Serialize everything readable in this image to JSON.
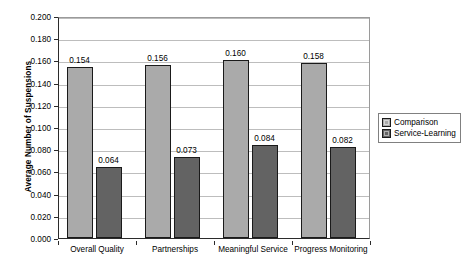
{
  "chart_data": {
    "type": "bar",
    "title": "",
    "xlabel": "",
    "ylabel": "Average Number of Suspensions",
    "ylim": [
      0,
      0.2
    ],
    "ytick_step": 0.02,
    "ytick_labels": [
      "0.000",
      "0.020",
      "0.040",
      "0.060",
      "0.080",
      "0.100",
      "0.120",
      "0.140",
      "0.160",
      "0.180",
      "0.200"
    ],
    "ytick_values": [
      0,
      0.02,
      0.04,
      0.06,
      0.08,
      0.1,
      0.12,
      0.14,
      0.16,
      0.18,
      0.2
    ],
    "grid": true,
    "legend_position": "right",
    "categories": [
      "Overall Quality",
      "Partnerships",
      "Meaningful Service",
      "Progress Monitoring"
    ],
    "series": [
      {
        "name": "Comparison",
        "color": "#aaaaaa",
        "values": [
          0.154,
          0.156,
          0.16,
          0.158
        ],
        "labels": [
          "0.154",
          "0.156",
          "0.160",
          "0.158"
        ]
      },
      {
        "name": "Service-Learning",
        "color": "#636363",
        "values": [
          0.064,
          0.073,
          0.084,
          0.082
        ],
        "labels": [
          "0.064",
          "0.073",
          "0.084",
          "0.082"
        ]
      }
    ]
  },
  "legend": {
    "items": [
      {
        "label": "Comparison",
        "swatch": "comparison"
      },
      {
        "label": "Service-Learning",
        "swatch": "service"
      }
    ]
  },
  "colors": {
    "comparison": "#aaaaaa",
    "service_learning": "#636363",
    "axis": "#2b2b2b",
    "gridline": "#bdbdbd",
    "background": "#ffffff"
  }
}
